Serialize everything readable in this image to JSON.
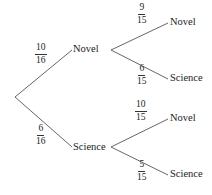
{
  "diagram": {
    "type": "probability-tree",
    "colors": {
      "line": "#555555",
      "text": "#222222",
      "background": "#ffffff"
    },
    "level1": [
      {
        "label": "Novel",
        "prob": {
          "num": "10",
          "den": "16"
        }
      },
      {
        "label": "Science",
        "prob": {
          "num": "6",
          "den": "16"
        }
      }
    ],
    "level2": {
      "novel": [
        {
          "label": "Novel",
          "prob": {
            "num": "9",
            "den": "15"
          }
        },
        {
          "label": "Science",
          "prob": {
            "num": "6",
            "den": "15"
          }
        }
      ],
      "science": [
        {
          "label": "Novel",
          "prob": {
            "num": "10",
            "den": "15"
          }
        },
        {
          "label": "Science",
          "prob": {
            "num": "5",
            "den": "15"
          }
        }
      ]
    }
  }
}
